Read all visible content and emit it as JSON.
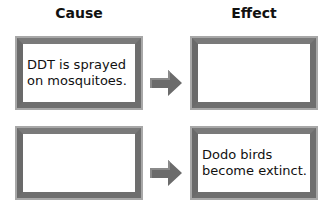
{
  "headers": {
    "cause": "Cause",
    "effect": "Effect"
  },
  "rows": [
    {
      "cause": "DDT is sprayed\non mosquitoes.",
      "effect": ""
    },
    {
      "cause": "",
      "effect": "Dodo birds\nbecome extinct."
    }
  ],
  "colors": {
    "frame": "#6e6e6e",
    "arrow": "#6b6b6b"
  }
}
